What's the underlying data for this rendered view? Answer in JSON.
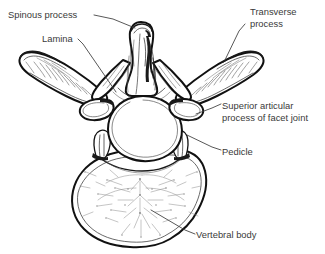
{
  "figure": {
    "background_color": "#ffffff",
    "ink_color": "#111111",
    "text_color": "#3a3a3a"
  },
  "labels": [
    {
      "id": "spinous-process",
      "lines": [
        "Spinous process"
      ],
      "text": "Spinous process",
      "x": 8,
      "y": 18,
      "anchor": "start"
    },
    {
      "id": "lamina",
      "lines": [
        "Lamina"
      ],
      "text": "Lamina",
      "x": 42,
      "y": 42,
      "anchor": "start"
    },
    {
      "id": "transverse-process",
      "lines": [
        "Transverse",
        "process"
      ],
      "text": "Transverse process",
      "x": 250,
      "y": 15,
      "anchor": "start"
    },
    {
      "id": "superior-articular-process",
      "lines": [
        "Superior articular",
        "process of facet joint"
      ],
      "text": "Superior articular process of facet joint",
      "x": 222,
      "y": 109,
      "anchor": "start"
    },
    {
      "id": "pedicle",
      "lines": [
        "Pedicle"
      ],
      "text": "Pedicle",
      "x": 222,
      "y": 155,
      "anchor": "start"
    },
    {
      "id": "vertebral-body",
      "lines": [
        "Vertebral body"
      ],
      "text": "Vertebral body",
      "x": 196,
      "y": 238,
      "anchor": "start"
    }
  ],
  "parts": [
    {
      "id": "spinous-process",
      "name": "Spinous process"
    },
    {
      "id": "lamina",
      "name": "Lamina"
    },
    {
      "id": "transverse-process-left",
      "name": "Transverse process (left)"
    },
    {
      "id": "transverse-process-right",
      "name": "Transverse process (right)"
    },
    {
      "id": "superior-articular-process",
      "name": "Superior articular process of facet joint"
    },
    {
      "id": "pedicle",
      "name": "Pedicle"
    },
    {
      "id": "vertebral-body",
      "name": "Vertebral body"
    },
    {
      "id": "vertebral-foramen",
      "name": "Vertebral foramen"
    }
  ]
}
